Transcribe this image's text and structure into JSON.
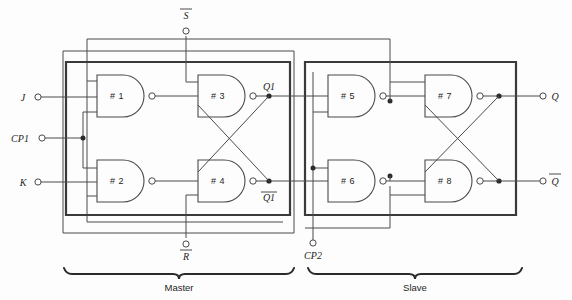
{
  "diagram": {
    "gates": [
      {
        "id": "g1",
        "label": "# 1",
        "x": 97,
        "y": 75,
        "w": 52,
        "h": 42
      },
      {
        "id": "g2",
        "label": "# 2",
        "x": 97,
        "y": 160,
        "w": 52,
        "h": 42
      },
      {
        "id": "g3",
        "label": "# 3",
        "x": 198,
        "y": 75,
        "w": 52,
        "h": 42
      },
      {
        "id": "g4",
        "label": "# 4",
        "x": 198,
        "y": 160,
        "w": 52,
        "h": 42
      },
      {
        "id": "g5",
        "label": "# 5",
        "x": 328,
        "y": 75,
        "w": 52,
        "h": 42
      },
      {
        "id": "g6",
        "label": "# 6",
        "x": 328,
        "y": 160,
        "w": 52,
        "h": 42
      },
      {
        "id": "g7",
        "label": "# 7",
        "x": 425,
        "y": 75,
        "w": 52,
        "h": 42
      },
      {
        "id": "g8",
        "label": "# 8",
        "x": 425,
        "y": 160,
        "w": 52,
        "h": 42
      }
    ],
    "terminals": [
      {
        "id": "j",
        "label": "J",
        "x": 35,
        "y": 97,
        "side": "left"
      },
      {
        "id": "cp1",
        "label": "CP1",
        "x": 35,
        "y": 138,
        "side": "left"
      },
      {
        "id": "k",
        "label": "K",
        "x": 35,
        "y": 182,
        "side": "left"
      },
      {
        "id": "sbar",
        "label": "S",
        "overbar": true,
        "x": 186,
        "y": 30,
        "side": "top"
      },
      {
        "id": "rbar",
        "label": "R",
        "overbar": true,
        "x": 186,
        "y": 244,
        "side": "bottom"
      },
      {
        "id": "cp2",
        "label": "CP2",
        "x": 313,
        "y": 243,
        "side": "bottom"
      },
      {
        "id": "q",
        "label": "Q",
        "x": 543,
        "y": 97,
        "side": "right"
      },
      {
        "id": "qbar",
        "label": "Q",
        "overbar": true,
        "x": 543,
        "y": 185,
        "side": "right"
      }
    ],
    "node_labels": [
      {
        "id": "q1",
        "label": "Q1",
        "x": 269,
        "y": 90
      },
      {
        "id": "q1bar",
        "label": "Q1",
        "overbar": true,
        "x": 269,
        "y": 205
      }
    ],
    "sections": [
      {
        "id": "master",
        "label": "Master",
        "x1": 64,
        "x2": 294,
        "y": 272,
        "label_x": 179,
        "label_y": 290
      },
      {
        "id": "slave",
        "label": "Slave",
        "x1": 308,
        "x2": 522,
        "y": 272,
        "label_x": 415,
        "label_y": 290
      }
    ],
    "colors": {
      "wire": "#4a4a4a",
      "wire_bold": "#3a3a3a",
      "text": "#1d1d1d",
      "background": "#fdfdfd",
      "junction": "#2b2b2b"
    }
  }
}
